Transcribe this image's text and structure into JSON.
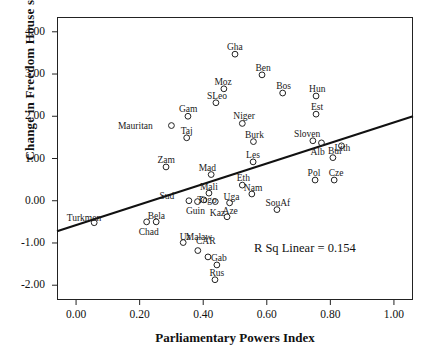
{
  "chart_data": {
    "type": "scatter",
    "title": "",
    "xlabel": "Parliamentary Powers Index",
    "ylabel": "Change in Freedom House score",
    "xlim": [
      -0.06,
      1.06
    ],
    "ylim": [
      -2.35,
      4.35
    ],
    "xticks": [
      "0.00",
      "0.20",
      "0.40",
      "0.60",
      "0.80",
      "1.00"
    ],
    "xtick_values": [
      0.0,
      0.2,
      0.4,
      0.6,
      0.8,
      1.0
    ],
    "yticks": [
      "4.00",
      "3.00",
      "2.00",
      "1.00",
      "0.00",
      "-1.00",
      "-2.00"
    ],
    "ytick_values": [
      4,
      3,
      2,
      1,
      0,
      -1,
      -2
    ],
    "grid": false,
    "legend": null,
    "annotation": "R Sq Linear = 0.154",
    "annotation_x": 0.72,
    "annotation_y": -1.15,
    "fit_line": {
      "x0": -0.06,
      "y0": -0.72,
      "x1": 1.06,
      "y1": 2.0
    },
    "marker": "open-circle",
    "points": [
      {
        "label": "Gha",
        "x": 0.5,
        "y": 3.47,
        "lx": 0,
        "ly": -11
      },
      {
        "label": "Ben",
        "x": 0.585,
        "y": 2.98,
        "lx": 1,
        "ly": -11
      },
      {
        "label": "Moz",
        "x": 0.465,
        "y": 2.65,
        "lx": -1,
        "ly": -11
      },
      {
        "label": "Bos",
        "x": 0.65,
        "y": 2.55,
        "lx": 1,
        "ly": -11
      },
      {
        "label": "Hun",
        "x": 0.755,
        "y": 2.48,
        "lx": 1,
        "ly": -11
      },
      {
        "label": "SLeo",
        "x": 0.44,
        "y": 2.32,
        "lx": 1,
        "ly": -11
      },
      {
        "label": "Est",
        "x": 0.755,
        "y": 2.05,
        "lx": 1,
        "ly": -11
      },
      {
        "label": "Gam",
        "x": 0.352,
        "y": 2.0,
        "lx": 0,
        "ly": -11
      },
      {
        "label": "Niger",
        "x": 0.523,
        "y": 1.83,
        "lx": 2,
        "ly": -11
      },
      {
        "label": "Mauritan",
        "x": 0.3,
        "y": 1.78,
        "lx": -36,
        "ly": -4
      },
      {
        "label": "Taj",
        "x": 0.348,
        "y": 1.49,
        "lx": 0,
        "ly": -11
      },
      {
        "label": "Burk",
        "x": 0.558,
        "y": 1.4,
        "lx": 1,
        "ly": -11
      },
      {
        "label": "Sloven",
        "x": 0.745,
        "y": 1.42,
        "lx": -6,
        "ly": -11
      },
      {
        "label": "Alb",
        "x": 0.772,
        "y": 1.37,
        "lx": -4,
        "ly": 5
      },
      {
        "label": "Lith",
        "x": 0.835,
        "y": 1.3,
        "lx": 1,
        "ly": -2
      },
      {
        "label": "Bul",
        "x": 0.808,
        "y": 1.02,
        "lx": 2,
        "ly": -11
      },
      {
        "label": "Les",
        "x": 0.557,
        "y": 0.92,
        "lx": 0,
        "ly": -11
      },
      {
        "label": "Zam",
        "x": 0.283,
        "y": 0.8,
        "lx": 0,
        "ly": -11
      },
      {
        "label": "Mad",
        "x": 0.425,
        "y": 0.62,
        "lx": -4,
        "ly": -11
      },
      {
        "label": "Pol",
        "x": 0.752,
        "y": 0.49,
        "lx": -1,
        "ly": -11
      },
      {
        "label": "Cze",
        "x": 0.812,
        "y": 0.49,
        "lx": 2,
        "ly": -11
      },
      {
        "label": "Eth",
        "x": 0.523,
        "y": 0.37,
        "lx": 1,
        "ly": -11
      },
      {
        "label": "Mali",
        "x": 0.418,
        "y": 0.18,
        "lx": 0,
        "ly": -10
      },
      {
        "label": "Nam",
        "x": 0.553,
        "y": 0.16,
        "lx": 1,
        "ly": -10
      },
      {
        "label": "Sud",
        "x": 0.355,
        "y": 0.0,
        "lx": -22,
        "ly": -9
      },
      {
        "label": "Togo",
        "x": 0.402,
        "y": 0.02,
        "lx": 3,
        "ly": -4
      },
      {
        "label": "Guin",
        "x": 0.382,
        "y": -0.02,
        "lx": -2,
        "ly": 5
      },
      {
        "label": "Kaz",
        "x": 0.438,
        "y": -0.02,
        "lx": 2,
        "ly": 7
      },
      {
        "label": "Uga",
        "x": 0.483,
        "y": -0.05,
        "lx": 2,
        "ly": -10
      },
      {
        "label": "SouAf",
        "x": 0.632,
        "y": -0.21,
        "lx": 1,
        "ly": -11
      },
      {
        "label": "Aze",
        "x": 0.475,
        "y": -0.38,
        "lx": 3,
        "ly": -10
      },
      {
        "label": "Turkmen",
        "x": 0.057,
        "y": -0.52,
        "lx": -10,
        "ly": -9
      },
      {
        "label": "Bela",
        "x": 0.252,
        "y": -0.5,
        "lx": 0,
        "ly": -10
      },
      {
        "label": "Chad",
        "x": 0.222,
        "y": -0.5,
        "lx": 2,
        "ly": 6
      },
      {
        "label": "Uz",
        "x": 0.337,
        "y": -0.99,
        "lx": 2,
        "ly": -10
      },
      {
        "label": "Malaw",
        "x": 0.383,
        "y": -1.18,
        "lx": 1,
        "ly": -18
      },
      {
        "label": "CAR",
        "x": 0.415,
        "y": -1.33,
        "lx": -2,
        "ly": -20
      },
      {
        "label": "Gab",
        "x": 0.443,
        "y": -1.52,
        "lx": 2,
        "ly": -11
      },
      {
        "label": "Rus",
        "x": 0.437,
        "y": -1.87,
        "lx": 2,
        "ly": -11
      }
    ]
  }
}
